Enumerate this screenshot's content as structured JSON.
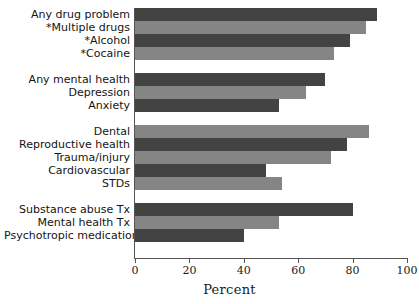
{
  "chart_data": {
    "type": "bar",
    "orientation": "horizontal",
    "title": "",
    "xlabel": "Percent",
    "ylabel": "",
    "xlim": [
      0,
      100
    ],
    "xticks": [
      0,
      20,
      40,
      60,
      80,
      100
    ],
    "grid": false,
    "legend": null,
    "bar_colors": [
      "#434343",
      "#858585"
    ],
    "groups": [
      {
        "name": "substance-use",
        "categories": [
          "Any drug problem",
          "*Multiple drugs",
          "*Alcohol",
          "*Cocaine"
        ],
        "values": [
          89,
          85,
          79,
          73
        ]
      },
      {
        "name": "mental-health",
        "categories": [
          "Any mental health",
          "Depression",
          "Anxiety"
        ],
        "values": [
          70,
          63,
          53
        ]
      },
      {
        "name": "medical-needs",
        "categories": [
          "Dental",
          "Reproductive health",
          "Trauma/injury",
          "Cardiovascular",
          "STDs"
        ],
        "values": [
          86,
          78,
          72,
          48,
          54
        ]
      },
      {
        "name": "treatment",
        "categories": [
          "Substance abuse Tx",
          "Mental health Tx",
          "Psychotropic medications"
        ],
        "values": [
          80,
          53,
          40
        ]
      }
    ]
  },
  "axis": {
    "x_title": "Percent",
    "tick_labels": [
      "0",
      "20",
      "40",
      "60",
      "80",
      "100"
    ]
  }
}
